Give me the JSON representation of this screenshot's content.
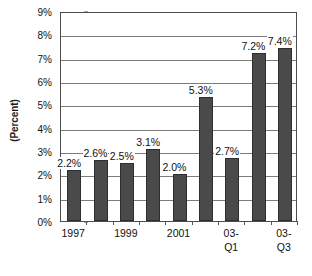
{
  "chart_data": {
    "type": "bar",
    "title": "",
    "subtitle": "",
    "xlabel": "",
    "ylabel": "(Percent)",
    "ylim": [
      0,
      9
    ],
    "grid": true,
    "legend": false,
    "legend_position": "none",
    "bar_color": "#4a4a4a",
    "categories": [
      "1997",
      "",
      "1999",
      "",
      "2001",
      "",
      "03-\nQ1",
      "",
      "03-\nQ3"
    ],
    "tick_labels": [
      "1997",
      "",
      "1999",
      "",
      "2001",
      "",
      "03-\nQ1",
      "",
      "03-\nQ3"
    ],
    "values": [
      2.2,
      2.6,
      2.5,
      3.1,
      2.0,
      5.3,
      2.7,
      7.2,
      7.4
    ],
    "data_labels": [
      "2.2%",
      "2.6%",
      "2.5%",
      "3.1%",
      "2.0%",
      "5.3%",
      "2.7%",
      "7.2%",
      "7.4%"
    ],
    "y_ticks": [
      0,
      1,
      2,
      3,
      4,
      5,
      6,
      7,
      8,
      9
    ],
    "y_tick_labels": [
      "0%",
      "1%",
      "2%",
      "3%",
      "4%",
      "5%",
      "6%",
      "7%",
      "8%",
      "9%"
    ]
  }
}
